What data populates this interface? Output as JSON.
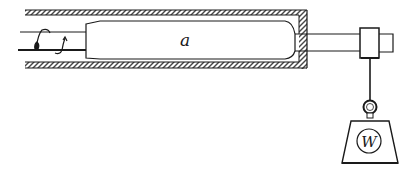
{
  "diagram": {
    "labels": {
      "body": "a",
      "weight": "W"
    },
    "colors": {
      "ink": "#1a1a1a",
      "paper": "#ffffff"
    },
    "components": [
      "tube-with-hatched-walls",
      "cylindrical-body-a",
      "rod",
      "collar",
      "hanging-string",
      "ring",
      "weight-W",
      "twisted-wire-left"
    ]
  }
}
